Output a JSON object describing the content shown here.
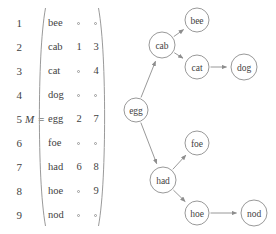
{
  "figure": {
    "matrix": {
      "name": "M",
      "label": "M =",
      "label_row": 5,
      "nil_symbol": "∘",
      "columns": [
        "word",
        "left",
        "right"
      ],
      "row_indices": [
        "1",
        "2",
        "3",
        "4",
        "5",
        "6",
        "7",
        "8",
        "9"
      ],
      "rows": [
        {
          "index": "1",
          "word": "bee",
          "col2": "",
          "col3": ""
        },
        {
          "index": "2",
          "word": "cab",
          "col2": "1",
          "col3": "3"
        },
        {
          "index": "3",
          "word": "cat",
          "col2": "",
          "col3": "4"
        },
        {
          "index": "4",
          "word": "dog",
          "col2": "",
          "col3": ""
        },
        {
          "index": "5",
          "word": "egg",
          "col2": "2",
          "col3": "7"
        },
        {
          "index": "6",
          "word": "foe",
          "col2": "",
          "col3": ""
        },
        {
          "index": "7",
          "word": "had",
          "col2": "6",
          "col3": "8"
        },
        {
          "index": "8",
          "word": "hoe",
          "col2": "",
          "col3": "9"
        },
        {
          "index": "9",
          "word": "nod",
          "col2": "",
          "col3": ""
        }
      ]
    },
    "graph": {
      "nodes": [
        {
          "id": "egg",
          "label": "egg",
          "cx": 18,
          "cy": 110,
          "r": 12
        },
        {
          "id": "cab",
          "label": "cab",
          "cx": 44,
          "cy": 45,
          "r": 13
        },
        {
          "id": "bee",
          "label": "bee",
          "cx": 79,
          "cy": 20,
          "r": 12
        },
        {
          "id": "cat",
          "label": "cat",
          "cx": 79,
          "cy": 67,
          "r": 12
        },
        {
          "id": "dog",
          "label": "dog",
          "cx": 126,
          "cy": 67,
          "r": 13
        },
        {
          "id": "had",
          "label": "had",
          "cx": 45,
          "cy": 180,
          "r": 13
        },
        {
          "id": "foe",
          "label": "foe",
          "cx": 79,
          "cy": 143,
          "r": 12
        },
        {
          "id": "hoe",
          "label": "hoe",
          "cx": 79,
          "cy": 213,
          "r": 12
        },
        {
          "id": "nod",
          "label": "nod",
          "cx": 136,
          "cy": 213,
          "r": 13
        }
      ],
      "edges": [
        {
          "from": "egg",
          "to": "cab"
        },
        {
          "from": "egg",
          "to": "had"
        },
        {
          "from": "cab",
          "to": "bee"
        },
        {
          "from": "cab",
          "to": "cat"
        },
        {
          "from": "cat",
          "to": "dog"
        },
        {
          "from": "had",
          "to": "foe"
        },
        {
          "from": "had",
          "to": "hoe"
        },
        {
          "from": "hoe",
          "to": "nod"
        }
      ]
    }
  },
  "colors": {
    "ink": "#3f3f3f",
    "stroke": "#8d8d8d",
    "background": "#ffffff"
  }
}
